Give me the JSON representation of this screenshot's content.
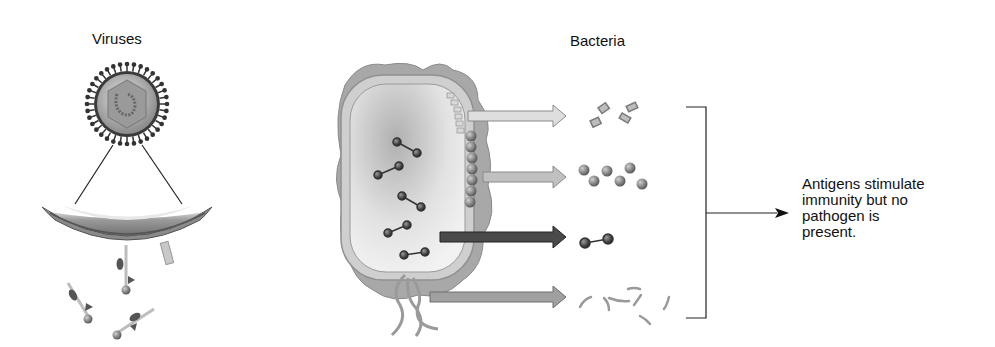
{
  "labels": {
    "viruses": "Viruses",
    "bacteria": "Bacteria"
  },
  "result": {
    "lines": [
      "Antigens stimulate",
      "immunity but no",
      "pathogen is",
      "present."
    ]
  },
  "diagram": {
    "left_panel": "virus particle with spiked envelope, magnified membrane section releasing surface antigen fragments",
    "center_panel": "bacterial cell with capsule, cell wall, surface proteins, toxins and flagella",
    "arrows": [
      {
        "shade": "light",
        "target": "capsule polysaccharide fragments"
      },
      {
        "shade": "medium",
        "target": "surface protein spheres"
      },
      {
        "shade": "dark",
        "target": "toxoid molecule"
      },
      {
        "shade": "medium-dark",
        "target": "flagella fragments"
      }
    ],
    "bracket_arrow": "points to result text"
  },
  "colors": {
    "text": "#111111",
    "arrow_light": "#d9d9d9",
    "arrow_medium": "#b8b8b8",
    "arrow_dark": "#4a4a4a",
    "arrow_mediumdark": "#9a9a9a",
    "cell_outer": "#a8a8a8",
    "cell_inner": "#e4e4e4"
  }
}
